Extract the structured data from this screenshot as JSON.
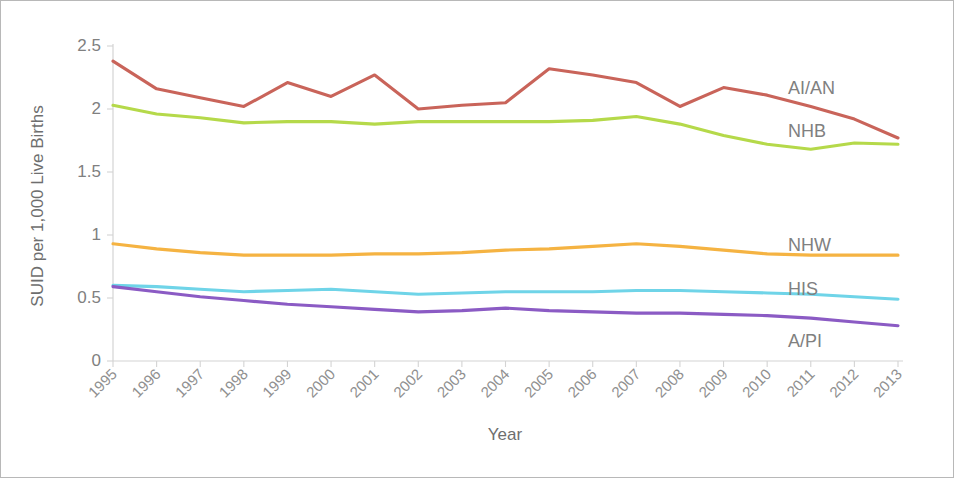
{
  "chart_data": {
    "type": "line",
    "title": "",
    "xlabel": "Year",
    "ylabel": "SUID per 1,000 Live Births",
    "x": [
      1995,
      1996,
      1997,
      1998,
      1999,
      2000,
      2001,
      2002,
      2003,
      2004,
      2005,
      2006,
      2007,
      2008,
      2009,
      2010,
      2011,
      2012,
      2013
    ],
    "categories": [
      "1995",
      "1996",
      "1997",
      "1998",
      "1999",
      "2000",
      "2001",
      "2002",
      "2003",
      "2004",
      "2005",
      "2006",
      "2007",
      "2008",
      "2009",
      "2010",
      "2011",
      "2012",
      "2013"
    ],
    "xlim": [
      1995,
      2013
    ],
    "ylim": [
      0,
      2.5
    ],
    "yticks": [
      0,
      0.5,
      1,
      1.5,
      2,
      2.5
    ],
    "ytick_labels": [
      "0",
      "0.5",
      "1",
      "1.5",
      "2",
      "2.5"
    ],
    "grid": false,
    "legend": "inline-right-labels",
    "series": [
      {
        "name": "AI/AN",
        "label": "AI/AN",
        "color": "#c9645a",
        "values": [
          2.38,
          2.16,
          2.09,
          2.02,
          2.21,
          2.1,
          2.27,
          2.0,
          2.03,
          2.05,
          2.32,
          2.27,
          2.21,
          2.02,
          2.17,
          2.11,
          2.02,
          1.92,
          1.77
        ]
      },
      {
        "name": "NHB",
        "label": "NHB",
        "color": "#b5d94a",
        "values": [
          2.03,
          1.96,
          1.93,
          1.89,
          1.9,
          1.9,
          1.88,
          1.9,
          1.9,
          1.9,
          1.9,
          1.91,
          1.94,
          1.88,
          1.79,
          1.72,
          1.68,
          1.73,
          1.72
        ]
      },
      {
        "name": "NHW",
        "label": "NHW",
        "color": "#f5b342",
        "values": [
          0.93,
          0.89,
          0.86,
          0.84,
          0.84,
          0.84,
          0.85,
          0.85,
          0.86,
          0.88,
          0.89,
          0.91,
          0.93,
          0.91,
          0.88,
          0.85,
          0.84,
          0.84,
          0.84
        ]
      },
      {
        "name": "HIS",
        "label": "HIS",
        "color": "#6fd4e8",
        "values": [
          0.6,
          0.59,
          0.57,
          0.55,
          0.56,
          0.57,
          0.55,
          0.53,
          0.54,
          0.55,
          0.55,
          0.55,
          0.56,
          0.56,
          0.55,
          0.54,
          0.53,
          0.51,
          0.49
        ]
      },
      {
        "name": "A/PI",
        "label": "A/PI",
        "color": "#8b5bc4",
        "values": [
          0.59,
          0.55,
          0.51,
          0.48,
          0.45,
          0.43,
          0.41,
          0.39,
          0.4,
          0.42,
          0.4,
          0.39,
          0.38,
          0.38,
          0.37,
          0.36,
          0.34,
          0.31,
          0.28
        ]
      }
    ]
  }
}
